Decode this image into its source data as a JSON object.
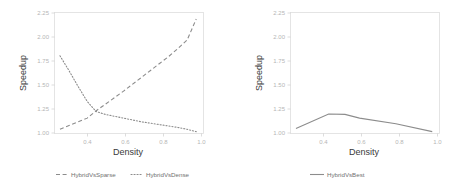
{
  "chart_data": [
    {
      "type": "line",
      "panel": "left",
      "title": "",
      "xlabel": "Density",
      "ylabel": "Speedup",
      "xlim": [
        0.22,
        1.04
      ],
      "ylim": [
        0.97,
        2.27
      ],
      "xticks": [
        0.4,
        0.6,
        0.8,
        1.0
      ],
      "xtick_labels": [
        "0.4",
        "0.6",
        "0.8",
        "1.0"
      ],
      "yticks": [
        1.0,
        1.25,
        1.5,
        1.75,
        2.0,
        2.25
      ],
      "ytick_labels": [
        "1.00",
        "1.25",
        "1.50",
        "1.75",
        "2.00",
        "2.25"
      ],
      "grid": false,
      "legend_position": "bottom",
      "series": [
        {
          "name": "HybridVsSparse",
          "style": "dashed",
          "color": "#8c8c8c",
          "x": [
            0.25,
            0.3,
            0.35,
            0.4,
            0.45,
            0.5,
            0.55,
            0.6,
            0.65,
            0.7,
            0.75,
            0.8,
            0.85,
            0.9,
            0.95,
            1.0
          ],
          "y": [
            1.015,
            1.055,
            1.095,
            1.135,
            1.215,
            1.285,
            1.355,
            1.425,
            1.5,
            1.575,
            1.65,
            1.725,
            1.8,
            1.885,
            1.975,
            2.2
          ]
        },
        {
          "name": "HybridVsDense",
          "style": "dotted",
          "color": "#8c8c8c",
          "x": [
            0.25,
            0.3,
            0.35,
            0.4,
            0.45,
            0.5,
            0.55,
            0.6,
            0.65,
            0.7,
            0.75,
            0.8,
            0.85,
            0.9,
            0.95,
            1.0
          ],
          "y": [
            1.805,
            1.645,
            1.475,
            1.315,
            1.205,
            1.175,
            1.155,
            1.135,
            1.115,
            1.095,
            1.08,
            1.065,
            1.05,
            1.035,
            1.015,
            0.99
          ]
        }
      ]
    },
    {
      "type": "line",
      "panel": "right",
      "title": "",
      "xlabel": "Density",
      "ylabel": "Speedup",
      "xlim": [
        0.22,
        1.04
      ],
      "ylim": [
        0.97,
        2.27
      ],
      "xticks": [
        0.4,
        0.6,
        0.8,
        1.0
      ],
      "xtick_labels": [
        "0.4",
        "0.6",
        "0.8",
        "1.0"
      ],
      "yticks": [
        1.0,
        1.25,
        1.5,
        1.75,
        2.0,
        2.25
      ],
      "ytick_labels": [
        "1.00",
        "1.25",
        "1.50",
        "1.75",
        "2.00",
        "2.25"
      ],
      "grid": false,
      "legend_position": "bottom",
      "series": [
        {
          "name": "HybridVsBest",
          "style": "solid",
          "color": "#8c8c8c",
          "x": [
            0.25,
            0.43,
            0.52,
            0.6,
            0.8,
            1.0
          ],
          "y": [
            1.025,
            1.18,
            1.175,
            1.135,
            1.075,
            0.99
          ]
        }
      ]
    }
  ],
  "left_panel": {
    "ylabel": "Speedup",
    "xlabel": "Density",
    "ytick_labels": [
      "2.25",
      "2.00",
      "1.75",
      "1.50",
      "1.25",
      "1.00"
    ],
    "xtick_labels": [
      "0.4",
      "0.6",
      "0.8",
      "1.0"
    ],
    "legend": [
      {
        "label": "HybridVsSparse",
        "style": "dashed"
      },
      {
        "label": "HybridVsDense",
        "style": "dotted"
      }
    ]
  },
  "right_panel": {
    "ylabel": "Speedup",
    "xlabel": "Density",
    "ytick_labels": [
      "2.25",
      "2.00",
      "1.75",
      "1.50",
      "1.25",
      "1.00"
    ],
    "xtick_labels": [
      "0.4",
      "0.6",
      "0.8",
      "1.0"
    ],
    "legend": [
      {
        "label": "HybridVsBest",
        "style": "solid"
      }
    ]
  },
  "colors": {
    "line": "#8c8c8c",
    "frame": "#dedede",
    "tick_text": "#b6b6b6",
    "axis_title": "#3a3a3a",
    "background": "#ffffff"
  }
}
